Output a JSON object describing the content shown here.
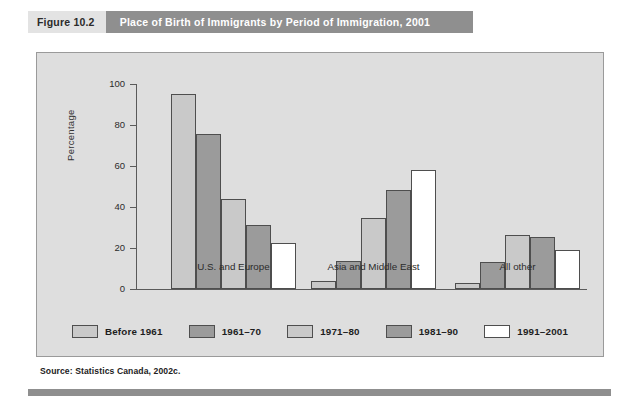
{
  "header": {
    "figure_number": "Figure 10.2",
    "title": "Place of Birth of Immigrants by Period of Immigration, 2001"
  },
  "source": "Source: Statistics Canada, 2002c.",
  "colors": {
    "header_band": "#8f8f8f",
    "figure_number_band": "#e3e3e3",
    "panel_background": "#dedede",
    "series_light": "#c9c9c9",
    "series_dark": "#9b9b9b",
    "series_white": "#ffffff",
    "axis": "#5a5a5a"
  },
  "chart_data": {
    "type": "bar",
    "title": "Place of Birth of Immigrants by Period of Immigration, 2001",
    "xlabel": "",
    "ylabel": "Percentage",
    "ylim": [
      0,
      100
    ],
    "yticks": [
      0,
      20,
      40,
      60,
      80,
      100
    ],
    "grid": false,
    "legend_position": "bottom",
    "categories": [
      "U.S. and Europe",
      "Asia and Middle East",
      "All other"
    ],
    "series": [
      {
        "name": "Before 1961",
        "values": [
          95,
          4,
          3
        ],
        "color": "#c9c9c9"
      },
      {
        "name": "1961–70",
        "values": [
          75.5,
          13.5,
          13
        ],
        "color": "#9b9b9b"
      },
      {
        "name": "1971–80",
        "values": [
          44,
          34.5,
          26.5
        ],
        "color": "#c9c9c9"
      },
      {
        "name": "1981–90",
        "values": [
          31,
          48.5,
          25.5
        ],
        "color": "#9b9b9b"
      },
      {
        "name": "1991–2001",
        "values": [
          22.5,
          58,
          19
        ],
        "color": "#ffffff"
      }
    ]
  }
}
